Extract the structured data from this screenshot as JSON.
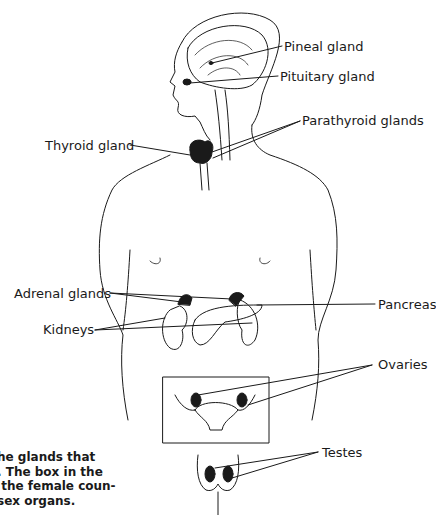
{
  "diagram": {
    "labels": {
      "pineal": "Pineal gland",
      "pituitary": "Pituitary gland",
      "parathyroid": "Parathyroid glands",
      "thyroid": "Thyroid gland",
      "adrenal": "Adrenal glands",
      "pancreas": "Pancreas",
      "kidneys": "Kidneys",
      "ovaries": "Ovaries",
      "testes": "Testes"
    },
    "caption": {
      "line1": "he glands that",
      "line2": ". The box in the",
      "line3": " the female coun-",
      "line4": "sex organs."
    },
    "colors": {
      "ink": "#1a1a1a",
      "background": "#ffffff"
    }
  }
}
